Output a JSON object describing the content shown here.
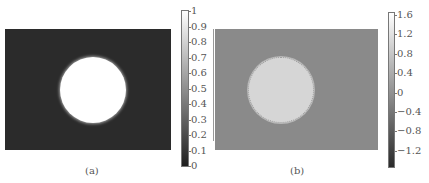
{
  "chart_data": [
    {
      "type": "heatmap",
      "panel_label": "(a)",
      "description": "Grayscale image: bright white circular disk centered on dark background",
      "colormap": "gray",
      "colorbar": {
        "min": 0,
        "max": 1,
        "ticks": [
          "1",
          "0.9",
          "0.8",
          "0.7",
          "0.6",
          "0.5",
          "0.4",
          "0.3",
          "0.2",
          "0.1",
          "0"
        ]
      },
      "regions": [
        {
          "name": "background",
          "value": 0.1
        },
        {
          "name": "disk",
          "value": 1.0,
          "center_frac": [
            0.53,
            0.5
          ],
          "radius_frac_of_height": 0.27
        }
      ],
      "axes_visible": false
    },
    {
      "type": "heatmap",
      "panel_label": "(b)",
      "description": "Grayscale image: light gray circular disk with speckled ring edge on mid-gray background",
      "colormap": "gray",
      "colorbar": {
        "min": -1.4,
        "max": 1.6,
        "ticks": [
          "1.6",
          "1.2",
          "0.8",
          "0.4",
          "0",
          "−0.4",
          "−0.8",
          "−1.2"
        ]
      },
      "regions": [
        {
          "name": "background",
          "value": 0.0
        },
        {
          "name": "disk",
          "value": 1.1,
          "center_frac": [
            0.41,
            0.5
          ],
          "radius_frac_of_height": 0.27
        }
      ],
      "axes_visible": false
    }
  ],
  "panels": {
    "a": {
      "caption": "(a)",
      "ticks": [
        "1",
        "0.9",
        "0.8",
        "0.7",
        "0.6",
        "0.5",
        "0.4",
        "0.3",
        "0.2",
        "0.1",
        "0"
      ]
    },
    "b": {
      "caption": "(b)",
      "ticks": [
        "1.6",
        "1.2",
        "0.8",
        "0.4",
        "0",
        "−0.4",
        "−0.8",
        "−1.2"
      ]
    }
  }
}
